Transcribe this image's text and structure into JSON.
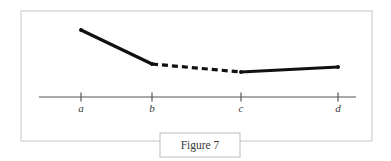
{
  "figure": {
    "caption": "Figure 7",
    "frame": {
      "x": 21,
      "y": 11,
      "width": 351,
      "height": 130,
      "color": "#d8d8d8"
    },
    "caption_box": {
      "x": 160,
      "y": 133,
      "width": 80,
      "height": 24,
      "border_color": "#c9c9c9",
      "text_color": "#3a3a3a"
    }
  },
  "chart_data": {
    "type": "line",
    "title": "Figure 7",
    "xlabel": "",
    "ylabel": "",
    "grid": false,
    "legend": null,
    "axis": {
      "line_color": "#555555",
      "y_pixel": 97,
      "x_start": 39,
      "x_end": 356,
      "tick_length": 9
    },
    "categories": [
      "a",
      "b",
      "c",
      "d"
    ],
    "tick_positions_px": [
      81,
      152,
      241,
      338
    ],
    "tick_labels": [
      "a",
      "b",
      "c",
      "d"
    ],
    "curve_color": "#111111",
    "curve_width": 3.2,
    "points": [
      {
        "label": "a",
        "x": 81,
        "y": 30
      },
      {
        "label": "b",
        "x": 152,
        "y": 64
      },
      {
        "label": "c",
        "x": 241,
        "y": 72
      },
      {
        "label": "d",
        "x": 338,
        "y": 67
      }
    ],
    "segments": [
      {
        "name": "a-to-b",
        "from": "a",
        "to": "b",
        "style": "solid"
      },
      {
        "name": "b-to-c",
        "from": "b",
        "to": "c",
        "style": "dashed",
        "dash_pattern": "6 4"
      },
      {
        "name": "c-to-d",
        "from": "c",
        "to": "d",
        "style": "solid"
      }
    ],
    "markers": [
      {
        "label": "a",
        "x": 81,
        "y": 30
      },
      {
        "label": "b",
        "x": 152,
        "y": 64
      },
      {
        "label": "c",
        "x": 241,
        "y": 72
      },
      {
        "label": "d",
        "x": 338,
        "y": 67
      }
    ],
    "label_y_px": 112
  }
}
